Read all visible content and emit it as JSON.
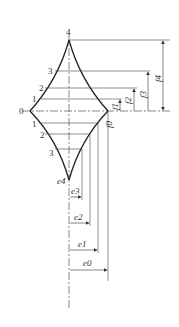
{
  "diagram": {
    "type": "cam-profile-construction",
    "vertex_labels": {
      "top": "4",
      "left": "0",
      "bottom": "e4"
    },
    "upper_division_labels": [
      "1",
      "2",
      "3"
    ],
    "lower_division_labels": [
      "1",
      "2",
      "3"
    ],
    "vertical_dimensions": [
      "f0",
      "f1",
      "f2",
      "f3",
      "f4"
    ],
    "horizontal_dimensions": [
      "e3",
      "e2",
      "e1",
      "e0"
    ],
    "colors": {
      "line": "#333333",
      "background": "#ffffff"
    }
  }
}
